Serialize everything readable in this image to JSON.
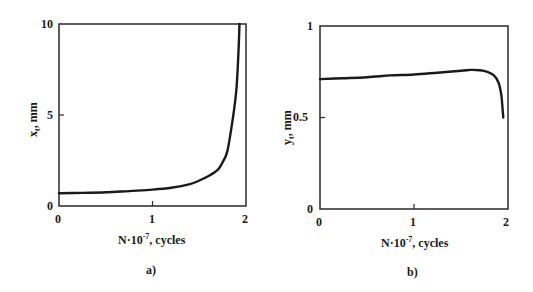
{
  "chart_data": [
    {
      "type": "line",
      "panel": "a)",
      "title": "",
      "xlabel_main": "N·10",
      "xlabel_exp": "-7",
      "xlabel_suffix": ", cycles",
      "ylabel_var": "x",
      "ylabel_sub": "t",
      "ylabel_unit": ", mm",
      "xlim": [
        0,
        2
      ],
      "ylim": [
        0,
        10
      ],
      "xticks": [
        "0",
        "1",
        "2"
      ],
      "yticks": [
        "0",
        "5",
        "10"
      ],
      "grid": false,
      "series": [
        {
          "name": "x_t",
          "x": [
            0,
            0.25,
            0.5,
            0.75,
            1.0,
            1.2,
            1.4,
            1.5,
            1.6,
            1.7,
            1.75,
            1.8,
            1.85,
            1.88,
            1.9,
            1.92,
            1.93
          ],
          "y": [
            0.7,
            0.72,
            0.75,
            0.82,
            0.9,
            1.0,
            1.2,
            1.4,
            1.65,
            2.0,
            2.4,
            3.0,
            4.5,
            5.6,
            6.6,
            8.5,
            10.0
          ]
        }
      ]
    },
    {
      "type": "line",
      "panel": "b)",
      "title": "",
      "xlabel_main": "N·10",
      "xlabel_exp": "-7",
      "xlabel_suffix": ", cycles",
      "ylabel_var": "y",
      "ylabel_sub": "t",
      "ylabel_unit": ", mm",
      "xlim": [
        0,
        2
      ],
      "ylim": [
        0,
        1
      ],
      "xticks": [
        "0",
        "1",
        "2"
      ],
      "yticks": [
        "0",
        "0.5",
        "1"
      ],
      "grid": false,
      "series": [
        {
          "name": "y_t",
          "x": [
            0,
            0.25,
            0.5,
            0.75,
            1.0,
            1.25,
            1.5,
            1.6,
            1.7,
            1.78,
            1.85,
            1.9,
            1.93,
            1.94,
            1.95
          ],
          "y": [
            0.71,
            0.715,
            0.72,
            0.73,
            0.735,
            0.745,
            0.755,
            0.76,
            0.758,
            0.75,
            0.73,
            0.69,
            0.62,
            0.56,
            0.5
          ]
        }
      ]
    }
  ],
  "panels": {
    "a": {
      "caption": "a)",
      "xtick0": "0",
      "xtick1": "1",
      "xtick2": "2",
      "ytick0": "0",
      "ytick1": "5",
      "ytick2": "10",
      "xlabel_main": "N·10",
      "xlabel_exp": "-7",
      "xlabel_suffix": ", cycles",
      "ylabel_var": "x",
      "ylabel_sub": "t",
      "ylabel_unit": ", mm"
    },
    "b": {
      "caption": "b)",
      "xtick0": "0",
      "xtick1": "1",
      "xtick2": "2",
      "ytick0": "0",
      "ytick1": "0.5",
      "ytick2": "1",
      "xlabel_main": "N·10",
      "xlabel_exp": "-7",
      "xlabel_suffix": ", cycles",
      "ylabel_var": "y",
      "ylabel_sub": "t",
      "ylabel_unit": ", mm"
    }
  },
  "colors": {
    "line": "#1a1a1a",
    "frame": "#2a2a2a",
    "background": "#ffffff"
  }
}
